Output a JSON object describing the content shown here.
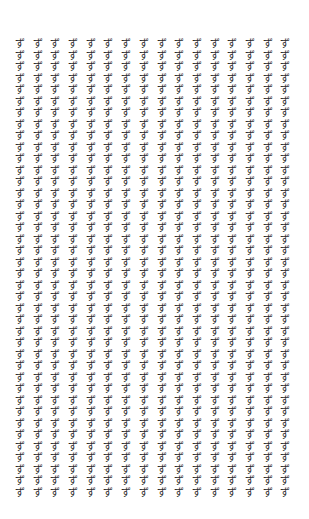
{
  "glyph_grid": {
    "character": "ず",
    "columns": 16,
    "rows": 40,
    "text_color": "#2a2a2a",
    "background_color": "#ffffff"
  }
}
